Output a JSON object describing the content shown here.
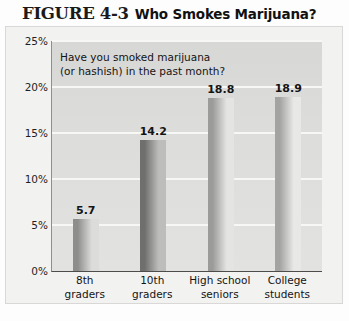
{
  "figure": {
    "number": "FIGURE 4-3",
    "title": "Who Smokes Marijuana?"
  },
  "annotation": {
    "line1": "Have you smoked marijuana",
    "line2": "(or hashish) in the past month?"
  },
  "chart_data": {
    "type": "bar",
    "title": "Who Smokes Marijuana?",
    "xlabel": "",
    "ylabel": "",
    "ylim": [
      0,
      25
    ],
    "grid": true,
    "legend": "none",
    "annotation": "Have you smoked marijuana (or hashish) in the past month?",
    "ytick_labels": [
      "0%",
      "5%",
      "10%",
      "15%",
      "20%",
      "25%"
    ],
    "ytick_values": [
      0,
      5,
      10,
      15,
      20,
      25
    ],
    "categories": [
      "8th graders",
      "10th graders",
      "High school seniors",
      "College students"
    ],
    "category_lines": [
      [
        "8th",
        "graders"
      ],
      [
        "10th",
        "graders"
      ],
      [
        "High school",
        "seniors"
      ],
      [
        "College",
        "students"
      ]
    ],
    "values": [
      5.7,
      14.2,
      18.8,
      18.9
    ],
    "value_labels": [
      "5.7",
      "14.2",
      "18.8",
      "18.9"
    ],
    "bar_colors": [
      "#8d8d8b",
      "#6f6f6e",
      "#9b9b99",
      "#a3a3a1"
    ],
    "bar_colors_light": [
      "#dcdcda",
      "#bdbdbb",
      "#e4e4e2",
      "#e8e8e6"
    ]
  },
  "colors": {
    "plot_background": "#dededd",
    "page_background": "#f2f2f1",
    "gridline": "#f7f7f6",
    "axis": "#4d4d4b",
    "text": "#141414"
  }
}
